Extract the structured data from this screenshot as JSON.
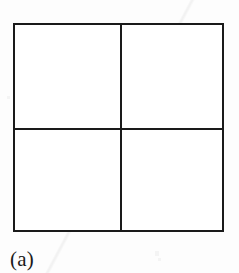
{
  "figure": {
    "caption": "(a)",
    "shape_name": "square",
    "line_color": "#1a1a1a",
    "fill_color": "#ffffff",
    "background_color": "#fdfdfd",
    "grid": {
      "rows": 2,
      "columns": 2,
      "total_cells": 4
    },
    "quadrants": [
      {
        "position": "top-left",
        "label": ""
      },
      {
        "position": "top-right",
        "label": ""
      },
      {
        "position": "bottom-left",
        "label": ""
      },
      {
        "position": "bottom-right",
        "label": ""
      }
    ]
  }
}
